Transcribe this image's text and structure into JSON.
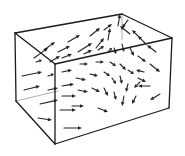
{
  "diagram": {
    "title": "",
    "colors": {
      "stroke": "#1a1a1a",
      "arrow": "#222222",
      "background": "#ffffff"
    },
    "box": {
      "vertices": {
        "back_top_left": [
          15,
          33
        ],
        "back_top_right": [
          122,
          14
        ],
        "front_top_left": [
          55,
          64
        ],
        "front_top_right": [
          172,
          38
        ],
        "front_bottom_left": [
          55,
          144
        ],
        "front_bottom_right": [
          169,
          108
        ],
        "back_bottom_left": [
          16,
          101
        ]
      },
      "edges": [
        [
          [
            15,
            33
          ],
          [
            122,
            14
          ]
        ],
        [
          [
            122,
            14
          ],
          [
            172,
            38
          ]
        ],
        [
          [
            15,
            33
          ],
          [
            55,
            64
          ]
        ],
        [
          [
            55,
            64
          ],
          [
            172,
            38
          ]
        ],
        [
          [
            15,
            33
          ],
          [
            16,
            101
          ]
        ],
        [
          [
            55,
            64
          ],
          [
            55,
            144
          ]
        ],
        [
          [
            172,
            38
          ],
          [
            169,
            108
          ]
        ],
        [
          [
            16,
            101
          ],
          [
            55,
            144
          ]
        ],
        [
          [
            55,
            144
          ],
          [
            169,
            108
          ]
        ]
      ],
      "hidden_edges": [
        [
          [
            122,
            14
          ],
          [
            122,
            40
          ]
        ],
        [
          [
            16,
            101
          ],
          [
            58,
            91
          ]
        ]
      ]
    },
    "arrows": [
      [
        34,
        58,
        48,
        48
      ],
      [
        44,
        50,
        55,
        42
      ],
      [
        68,
        42,
        80,
        35
      ],
      [
        90,
        36,
        100,
        28
      ],
      [
        104,
        30,
        112,
        24
      ],
      [
        58,
        52,
        70,
        46
      ],
      [
        78,
        52,
        92,
        43
      ],
      [
        96,
        48,
        104,
        38
      ],
      [
        108,
        40,
        110,
        28
      ],
      [
        118,
        26,
        120,
        14
      ],
      [
        130,
        34,
        120,
        26
      ],
      [
        140,
        38,
        132,
        30
      ],
      [
        146,
        44,
        138,
        36
      ],
      [
        156,
        52,
        147,
        45
      ],
      [
        128,
        20,
        122,
        28
      ],
      [
        36,
        62,
        42,
        60
      ],
      [
        50,
        62,
        60,
        56
      ],
      [
        62,
        58,
        72,
        54
      ],
      [
        84,
        54,
        92,
        50
      ],
      [
        98,
        50,
        104,
        46
      ],
      [
        108,
        52,
        112,
        48
      ],
      [
        114,
        48,
        116,
        54
      ],
      [
        122,
        44,
        124,
        52
      ],
      [
        130,
        48,
        134,
        56
      ],
      [
        138,
        56,
        146,
        62
      ],
      [
        150,
        64,
        160,
        72
      ],
      [
        144,
        72,
        136,
        70
      ],
      [
        22,
        76,
        42,
        72
      ],
      [
        48,
        76,
        54,
        74
      ],
      [
        62,
        72,
        72,
        70
      ],
      [
        80,
        64,
        88,
        64
      ],
      [
        96,
        62,
        104,
        62
      ],
      [
        110,
        62,
        116,
        66
      ],
      [
        120,
        64,
        126,
        70
      ],
      [
        128,
        70,
        134,
        74
      ],
      [
        138,
        78,
        146,
        82
      ],
      [
        24,
        90,
        40,
        86
      ],
      [
        48,
        90,
        58,
        88
      ],
      [
        62,
        86,
        74,
        84
      ],
      [
        76,
        78,
        86,
        80
      ],
      [
        90,
        74,
        98,
        76
      ],
      [
        104,
        72,
        110,
        76
      ],
      [
        112,
        78,
        116,
        84
      ],
      [
        120,
        76,
        122,
        84
      ],
      [
        128,
        84,
        126,
        92
      ],
      [
        140,
        82,
        134,
        88
      ],
      [
        150,
        86,
        138,
        86
      ],
      [
        40,
        104,
        58,
        100
      ],
      [
        62,
        96,
        76,
        96
      ],
      [
        78,
        90,
        88,
        92
      ],
      [
        92,
        88,
        100,
        92
      ],
      [
        104,
        88,
        108,
        96
      ],
      [
        114,
        92,
        116,
        100
      ],
      [
        124,
        96,
        122,
        106
      ],
      [
        136,
        96,
        132,
        104
      ],
      [
        160,
        94,
        150,
        100
      ],
      [
        38,
        118,
        52,
        120
      ],
      [
        60,
        110,
        76,
        110
      ],
      [
        72,
        106,
        84,
        106
      ],
      [
        98,
        108,
        108,
        112
      ],
      [
        64,
        128,
        82,
        128
      ]
    ]
  }
}
